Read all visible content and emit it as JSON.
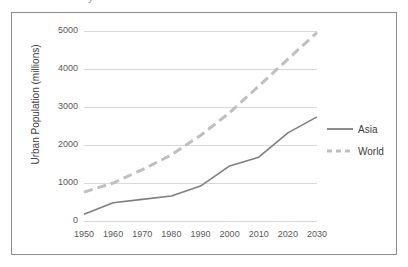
{
  "top_fragment": "y",
  "chart_data": {
    "type": "line",
    "title": "",
    "xlabel": "",
    "ylabel": "Urban Population (millions)",
    "x": [
      1950,
      1960,
      1970,
      1980,
      1990,
      2000,
      2010,
      2020,
      2030
    ],
    "xticklabels": [
      "1950",
      "1960",
      "1970",
      "1980",
      "1990",
      "2000",
      "2010",
      "2020",
      "2030"
    ],
    "yticks": [
      0,
      1000,
      2000,
      3000,
      4000,
      5000
    ],
    "yticklabels": [
      "0",
      "1000",
      "2000",
      "3000",
      "4000",
      "5000"
    ],
    "ylim": [
      0,
      5000
    ],
    "xlim": [
      1950,
      2030
    ],
    "grid": "horizontal",
    "legend_position": "right",
    "series": [
      {
        "name": "Asia",
        "style": "solid",
        "color": "#7f7f7f",
        "values": [
          180,
          480,
          570,
          660,
          920,
          1450,
          1680,
          2320,
          2740
        ]
      },
      {
        "name": "World",
        "style": "dashed",
        "color": "#bfbfbf",
        "values": [
          760,
          1000,
          1350,
          1740,
          2250,
          2850,
          3550,
          4260,
          4960
        ]
      }
    ]
  },
  "legend": {
    "items": [
      {
        "label": "Asia",
        "style": "solid",
        "color": "#7f7f7f"
      },
      {
        "label": "World",
        "style": "dashed",
        "color": "#bfbfbf"
      }
    ]
  },
  "colors": {
    "frame_border": "#8d8d8d",
    "gridline": "#d9d9d9",
    "tick_text": "#595959",
    "axis_title_text": "#404040",
    "background": "#ffffff"
  }
}
